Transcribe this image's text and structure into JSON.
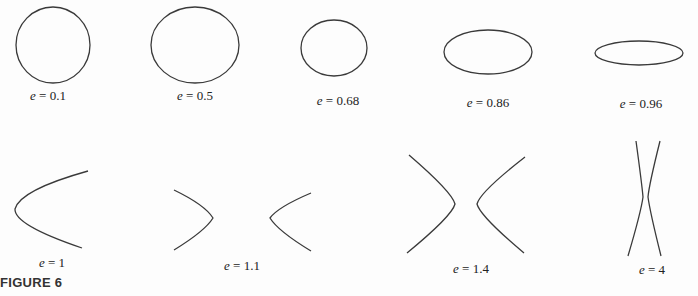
{
  "figure": {
    "caption": "FIGURE 6",
    "stroke_color": "#3a3a3a",
    "variable": "e",
    "equals": " = "
  },
  "conics": [
    {
      "id": "e-0-1",
      "type": "ellipse",
      "e_value": "0.1",
      "label": "0.1"
    },
    {
      "id": "e-0-5",
      "type": "ellipse",
      "e_value": "0.5",
      "label": "0.5"
    },
    {
      "id": "e-0-68",
      "type": "ellipse",
      "e_value": "0.68",
      "label": "0.68"
    },
    {
      "id": "e-0-86",
      "type": "ellipse",
      "e_value": "0.86",
      "label": "0.86"
    },
    {
      "id": "e-0-96",
      "type": "ellipse",
      "e_value": "0.96",
      "label": "0.96"
    },
    {
      "id": "e-1",
      "type": "parabola",
      "e_value": "1",
      "label": "1"
    },
    {
      "id": "e-1-1",
      "type": "hyperbola",
      "e_value": "1.1",
      "label": "1.1"
    },
    {
      "id": "e-1-4",
      "type": "hyperbola",
      "e_value": "1.4",
      "label": "1.4"
    },
    {
      "id": "e-4",
      "type": "hyperbola",
      "e_value": "4",
      "label": "4"
    }
  ]
}
